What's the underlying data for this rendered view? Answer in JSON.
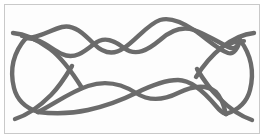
{
  "figure": {
    "title": "Knot diagram",
    "description": "Hand-drawn closed braid knot diagram with two strands",
    "background_color": "#ffffff",
    "panel_color": "#fdfdfd",
    "frame_color": "#c9c9c9",
    "stroke_color": "#6b6b6b",
    "stroke_width": 4.2,
    "width": 266,
    "height": 140
  },
  "diagram": {
    "type": "knot-braid",
    "strand_count": 2,
    "top_braid_crossings": 4,
    "bottom_braid_crossings": 2,
    "open_ends": 4,
    "end_labels": [
      "upper-left",
      "lower-left",
      "upper-right",
      "lower-right"
    ],
    "paths": {
      "top_strand_a": "M 18 36 C 34 32 44 44 58 52 C 74 60 86 50 98 42 C 110 34 122 44 134 52 C 148 60 160 44 174 36 C 188 28 200 40 214 47",
      "top_strand_b": "M 18 36 C 34 40 44 34 58 30 C 74 26 86 38 98 42 C 110 46 122 36 134 30 C 148 24 160 34 174 36 C 188 38 200 50 214 47",
      "bottom_strand_a": "M 34 77 C 54 74 70 84 90 90 C 110 96 126 86 142 80 C 160 74 180 82 200 90 C 216 96 226 103 236 110",
      "bottom_strand_b": "M 34 77 C 54 82 70 93 90 98 C 110 103 126 92 142 86 C 160 80 180 86 200 90 C 216 93 226 100 236 110",
      "left_arc": "M 24 34 C 12 56 14 86 34 104",
      "right_arc": "M 212 44 C 232 62 230 92 212 108",
      "end_upper_left": "M 12 32 C 22 34 34 44 44 54 C 54 64 62 78 72 92",
      "end_lower_left": "M 12 110 C 24 104 38 94 50 82",
      "end_upper_right": "M 252 34 C 240 36 226 46 214 58",
      "end_lower_right": "M 252 114 C 240 110 226 100 214 88"
    }
  },
  "meta": {
    "label_visible": false
  }
}
